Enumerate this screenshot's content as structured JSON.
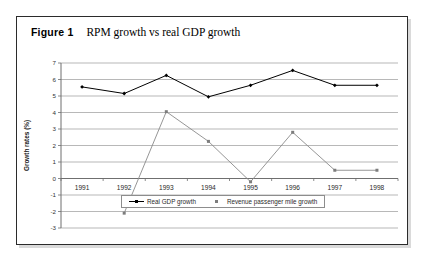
{
  "figure": {
    "label": "Figure 1",
    "caption": "RPM growth vs real GDP growth"
  },
  "legend": {
    "entries": [
      {
        "name": "Real GDP growth",
        "color": "#000000"
      },
      {
        "name": "Revenue passenger mile growth",
        "color": "#7d7d7d"
      }
    ]
  },
  "chart_data": {
    "type": "line",
    "title": "RPM growth vs real GDP growth",
    "xlabel": "",
    "ylabel": "Growth rates (%)",
    "categories": [
      "1991",
      "1992",
      "1993",
      "1994",
      "1995",
      "1996",
      "1997",
      "1998"
    ],
    "ylim": [
      -3,
      7
    ],
    "ytick_step": 1,
    "yticks": [
      "7",
      "6",
      "5",
      "4",
      "3",
      "2",
      "1",
      "0",
      "-1",
      "-2",
      "-3"
    ],
    "grid": true,
    "legend_position": "bottom",
    "series": [
      {
        "name": "Real GDP growth",
        "color": "#000000",
        "marker": "filled-diamond",
        "values": [
          5.55,
          5.15,
          6.25,
          4.95,
          5.65,
          6.55,
          5.65,
          5.65
        ]
      },
      {
        "name": "Revenue passenger mile growth",
        "color": "#7d7d7d",
        "marker": "filled-square",
        "values": [
          null,
          -2.1,
          4.05,
          2.25,
          -0.2,
          2.8,
          0.5,
          0.5
        ]
      }
    ]
  }
}
